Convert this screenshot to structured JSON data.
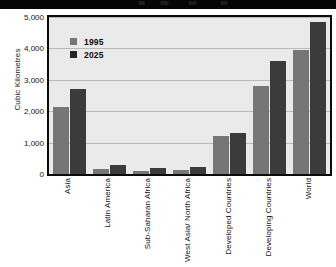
{
  "chart_data": {
    "type": "bar",
    "title": "",
    "subtitle": "",
    "xlabel": "",
    "ylabel": "Cubic Kilometres",
    "ylim": [
      0,
      5000
    ],
    "yticks": [
      0,
      1000,
      2000,
      3000,
      4000,
      5000
    ],
    "ytick_labels": [
      "0",
      "1,000",
      "2,000",
      "3,000",
      "4,000",
      "5,000"
    ],
    "grid": true,
    "grid_axis": "y",
    "legend_position": "top-left-inside",
    "orientation": "vertical",
    "categories": [
      "Asia",
      "Latin America",
      "Sub-Saharan Africa",
      "West Asia/ North Africa",
      "Developed Countries",
      "Developing Countries",
      "World"
    ],
    "series": [
      {
        "name": "1995",
        "color": "#767676",
        "values": [
          2150,
          150,
          100,
          130,
          1200,
          2800,
          3950
        ]
      },
      {
        "name": "2025",
        "color": "#3b3b3b",
        "values": [
          2700,
          280,
          180,
          230,
          1300,
          3600,
          4850
        ]
      }
    ]
  },
  "legend": {
    "entries": [
      {
        "label": "1995",
        "swatch": "legend-swatch-1995"
      },
      {
        "label": "2025",
        "swatch": "legend-swatch-2025"
      }
    ]
  },
  "axes": {
    "y_title": "Cubic Kilometres"
  },
  "colors": {
    "series_1995": "#767676",
    "series_2025": "#3b3b3b",
    "plot_background": "#eaeaea",
    "plot_border": "#0b0b0b",
    "gridline": "#b9b9b9",
    "top_band": "#050505",
    "text": "#111111"
  }
}
